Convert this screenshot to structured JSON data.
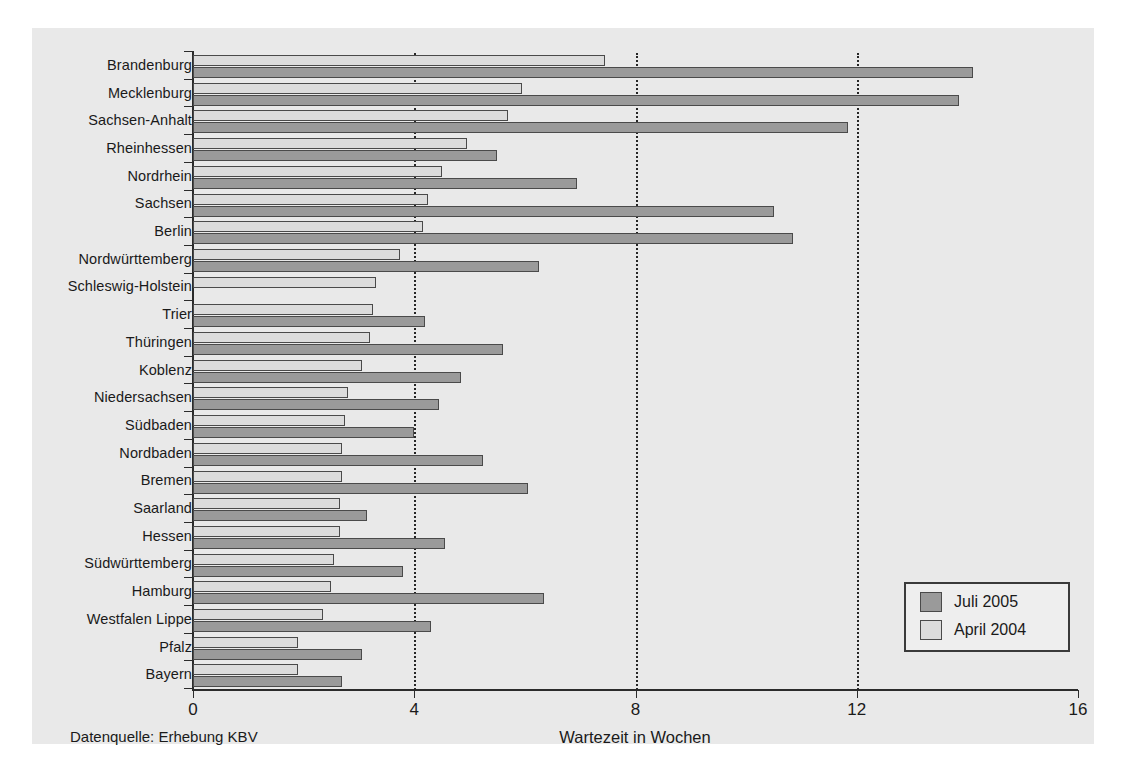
{
  "chart_data": {
    "type": "bar",
    "orientation": "horizontal",
    "title": "",
    "xlabel": "Wartezeit in Wochen",
    "ylabel": "",
    "xlim": [
      0,
      16
    ],
    "xticks": [
      0,
      4,
      8,
      12,
      16
    ],
    "grid": "vertical dotted at 4, 8, 12",
    "legend_position": "bottom-right",
    "source_note": "Datenquelle: Erhebung  KBV",
    "categories": [
      "Brandenburg",
      "Mecklenburg",
      "Sachsen-Anhalt",
      "Rheinhessen",
      "Nordrhein",
      "Sachsen",
      "Berlin",
      "Nordwürttemberg",
      "Schleswig-Holstein",
      "Trier",
      "Thüringen",
      "Koblenz",
      "Niedersachsen",
      "Südbaden",
      "Nordbaden",
      "Bremen",
      "Saarland",
      "Hessen",
      "Südwürttemberg",
      "Hamburg",
      "Westfalen Lippe",
      "Pfalz",
      "Bayern"
    ],
    "series": [
      {
        "name": "Juli 2005",
        "color": "#9a9a9a",
        "values": [
          14.1,
          13.85,
          11.85,
          5.5,
          6.95,
          10.5,
          10.85,
          6.25,
          0,
          4.2,
          5.6,
          4.85,
          4.45,
          4.0,
          5.25,
          6.05,
          3.15,
          4.55,
          3.8,
          6.35,
          4.3,
          3.05,
          2.7
        ]
      },
      {
        "name": "April 2004",
        "color": "#dcdcdc",
        "values": [
          7.45,
          5.95,
          5.7,
          4.95,
          4.5,
          4.25,
          4.15,
          3.75,
          3.3,
          3.25,
          3.2,
          3.05,
          2.8,
          2.75,
          2.7,
          2.7,
          2.65,
          2.65,
          2.55,
          2.5,
          2.35,
          1.9,
          1.9
        ]
      }
    ]
  },
  "legend": {
    "items": [
      {
        "label": "Juli 2005"
      },
      {
        "label": "April 2004"
      }
    ]
  },
  "axis": {
    "x_title": "Wartezeit in Wochen",
    "tick_labels": [
      "0",
      "4",
      "8",
      "12",
      "16"
    ]
  },
  "footer": {
    "source": "Datenquelle: Erhebung  KBV"
  }
}
